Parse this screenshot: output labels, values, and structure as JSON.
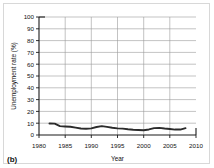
{
  "panel": {
    "label": "(b)"
  },
  "chart_data": {
    "type": "line",
    "title": "",
    "xlabel": "Year",
    "ylabel": "Unemployment rate (%)",
    "xlim": [
      1980,
      2010
    ],
    "ylim": [
      0,
      100
    ],
    "xticks": [
      1980,
      1985,
      1990,
      1995,
      2000,
      2005,
      2010
    ],
    "yticks": [
      0,
      10,
      20,
      30,
      40,
      50,
      60,
      70,
      80,
      90,
      100
    ],
    "xtick_labels": [
      "1980",
      "1985",
      "1990",
      "1995",
      "2000",
      "2005",
      "2010"
    ],
    "ytick_labels": [
      "0",
      "10",
      "20",
      "30",
      "40",
      "50",
      "60",
      "70",
      "80",
      "90",
      "100"
    ],
    "grid": "horizontal-and-vertical",
    "legend": "none",
    "line_color": "#2b2b2b",
    "series": [
      {
        "name": "Unemployment rate",
        "x": [
          1982,
          1983,
          1984,
          1985,
          1986,
          1987,
          1988,
          1989,
          1990,
          1991,
          1992,
          1993,
          1994,
          1995,
          1996,
          1997,
          1998,
          1999,
          2000,
          2001,
          2002,
          2003,
          2004,
          2005,
          2006,
          2007,
          2008
        ],
        "values": [
          9.7,
          9.6,
          7.5,
          7.2,
          7.0,
          6.2,
          5.5,
          5.3,
          5.6,
          6.8,
          7.5,
          6.9,
          6.1,
          5.6,
          5.4,
          4.9,
          4.5,
          4.2,
          4.0,
          4.7,
          5.8,
          6.0,
          5.5,
          5.1,
          4.6,
          4.6,
          5.8
        ]
      }
    ]
  }
}
